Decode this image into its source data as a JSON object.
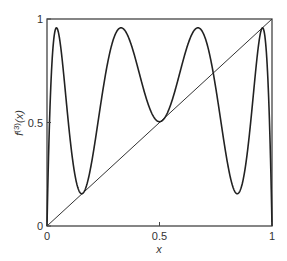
{
  "chart_data": {
    "type": "line",
    "title": "",
    "xlabel": "x",
    "ylabel": "f(3)(x)",
    "ylabel_base": "f",
    "ylabel_sup": "(3)",
    "ylabel_arg": "(x)",
    "xlim": [
      0,
      1
    ],
    "ylim": [
      0,
      1
    ],
    "grid": false,
    "legend": "none",
    "x_ticks": [
      0,
      0.5,
      1
    ],
    "x_tick_labels": [
      "0",
      "0.5",
      "1"
    ],
    "y_ticks": [
      0,
      0.5,
      1
    ],
    "y_tick_labels": [
      "0",
      "0.5",
      "1"
    ],
    "series": [
      {
        "name": "third iterate of logistic map f(x)=r x(1-x)",
        "r": 3.83,
        "description": "four-hump curve, maxima ~0.96 near x=0.05, 0.35, 0.70, 0.96; minima ~0.13 near x=0.16, ~0.48 near x=0.51, ~0.16 near x=0.84",
        "x": [
          0,
          0.05,
          0.16,
          0.35,
          0.51,
          0.7,
          0.84,
          0.96,
          1
        ],
        "values": [
          0,
          0.96,
          0.13,
          0.96,
          0.48,
          0.96,
          0.16,
          0.96,
          0
        ]
      },
      {
        "name": "diagonal y = x",
        "x": [
          0,
          1
        ],
        "values": [
          0,
          1
        ]
      }
    ]
  }
}
